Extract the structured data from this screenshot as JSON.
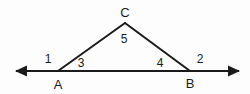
{
  "figure": {
    "type": "geometry-diagram",
    "background_color": "#fdfdfd",
    "stroke_color": "#1a1a1a",
    "stroke_width": 2,
    "canvas": {
      "width": 250,
      "height": 94
    },
    "points": {
      "A": {
        "x": 58,
        "y": 71
      },
      "B": {
        "x": 190,
        "y": 71
      },
      "C": {
        "x": 125,
        "y": 23
      },
      "line_left_tip": {
        "x": 15,
        "y": 71
      },
      "line_right_tip": {
        "x": 240,
        "y": 71
      }
    },
    "vertex_labels": [
      {
        "id": "C",
        "text": "C",
        "x": 125,
        "y": 17
      },
      {
        "id": "A",
        "text": "A",
        "x": 58,
        "y": 89
      },
      {
        "id": "B",
        "text": "B",
        "x": 190,
        "y": 88
      }
    ],
    "angle_labels": [
      {
        "id": "1",
        "text": "1",
        "x": 48,
        "y": 63
      },
      {
        "id": "3",
        "text": "3",
        "x": 81,
        "y": 67
      },
      {
        "id": "5",
        "text": "5",
        "x": 124,
        "y": 43
      },
      {
        "id": "4",
        "text": "4",
        "x": 160,
        "y": 67
      },
      {
        "id": "2",
        "text": "2",
        "x": 200,
        "y": 63
      }
    ],
    "segments": [
      {
        "id": "baseline",
        "from": "line_left_tip",
        "to": "line_right_tip",
        "arrows": "both"
      },
      {
        "id": "side-AC",
        "from": "A",
        "to": "C",
        "arrows": "none"
      },
      {
        "id": "side-CB",
        "from": "C",
        "to": "B",
        "arrows": "none"
      }
    ]
  }
}
